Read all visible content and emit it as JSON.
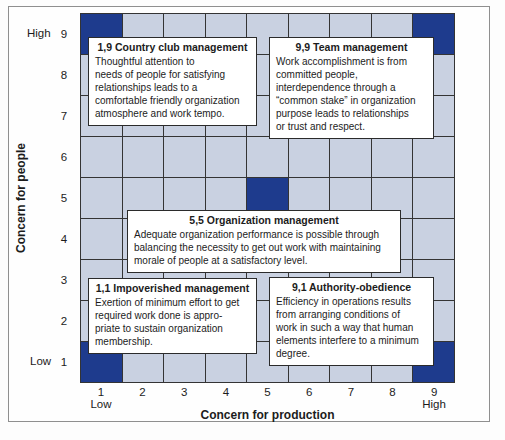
{
  "figure": {
    "y_axis": {
      "title": "Concern for people",
      "high_label": "High",
      "low_label": "Low",
      "ticks": [
        "9",
        "8",
        "7",
        "6",
        "5",
        "4",
        "3",
        "2",
        "1"
      ]
    },
    "x_axis": {
      "title": "Concern for production",
      "low_label": "Low",
      "high_label": "High",
      "ticks": [
        "1",
        "2",
        "3",
        "4",
        "5",
        "6",
        "7",
        "8",
        "9"
      ]
    },
    "grid": {
      "rows": 9,
      "cols": 9,
      "cell_color": "#c9d1e1",
      "highlight_color": "#1e3b8d",
      "line_color": "#343434",
      "highlight_cells": [
        [
          1,
          9
        ],
        [
          9,
          9
        ],
        [
          5,
          5
        ],
        [
          1,
          1
        ],
        [
          9,
          1
        ]
      ]
    },
    "boxes": [
      {
        "position": "1,9",
        "title": "1,9 Country club management",
        "body": "Thoughtful attention to\nneeds of people for satisfying\nrelationships leads to a\ncomfortable friendly organization\natmosphere and work tempo."
      },
      {
        "position": "9,9",
        "title": "9,9 Team management",
        "body": "Work accomplishment is from\ncommitted people,\ninterdependence through a\n“common stake” in organization\npurpose leads to relationships\nor trust and respect."
      },
      {
        "position": "5,5",
        "title": "5,5 Organization management",
        "body": "Adequate organization performance is possible through\nbalancing the necessity to get out work with maintaining\nmorale of people at a satisfactory level."
      },
      {
        "position": "1,1",
        "title": "1,1 Impoverished management",
        "body": "Exertion of minimum effort to get\nrequired work done is appro-\npriate to sustain organization\nmembership."
      },
      {
        "position": "9,1",
        "title": "9,1 Authority-obedience",
        "body": "Efficiency in operations results\nfrom arranging conditions of\nwork in such a way that human\nelements interfere to a minimum\ndegree."
      }
    ]
  },
  "chart_data": {
    "type": "scatter",
    "xlabel": "Concern for production",
    "ylabel": "Concern for people",
    "xlim": [
      1,
      9
    ],
    "ylim": [
      1,
      9
    ],
    "grid": true,
    "points": [
      {
        "x": 1,
        "y": 9,
        "label": "Country club management"
      },
      {
        "x": 9,
        "y": 9,
        "label": "Team management"
      },
      {
        "x": 5,
        "y": 5,
        "label": "Organization management"
      },
      {
        "x": 1,
        "y": 1,
        "label": "Impoverished management"
      },
      {
        "x": 9,
        "y": 1,
        "label": "Authority-obedience"
      }
    ]
  }
}
